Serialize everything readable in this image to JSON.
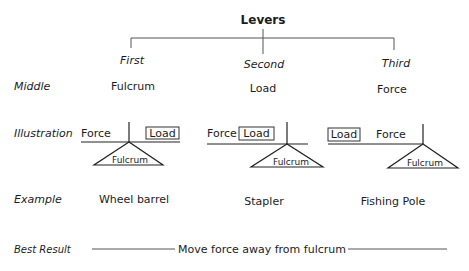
{
  "title": "Levers",
  "columns": [
    {
      "class": "First",
      "middle": "Fulcrum",
      "example": "Wheel barrel",
      "illustration": {
        "left_label": "Force",
        "right_label": "Load",
        "fulcrum_label": "Fulcrum",
        "order": "Force | pivot | Load"
      }
    },
    {
      "class": "Second",
      "middle": "Load",
      "example": "Stapler",
      "illustration": {
        "left_label": "Force",
        "right_label": "Load",
        "fulcrum_label": "Fulcrum",
        "order": "Force Load | pivot"
      }
    },
    {
      "class": "Third",
      "middle": "Force",
      "example": "Fishing Pole",
      "illustration": {
        "left_label": "Load",
        "right_label": "Force",
        "fulcrum_label": "Fulcrum",
        "order": "Load Force | pivot"
      }
    }
  ],
  "row_labels": {
    "middle": "Middle",
    "illustration": "Illustration",
    "example": "Example",
    "best_result": "Best Result"
  },
  "best_result": "Move force away from fulcrum",
  "colors": {
    "text": "#1c1c1c",
    "lines": "#555555",
    "background": "#ffffff"
  }
}
